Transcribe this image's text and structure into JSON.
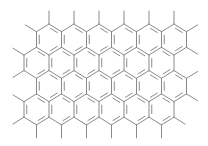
{
  "diagram": {
    "type": "chemical-structure",
    "line_color": "#8a8a8a",
    "background": "#ffffff",
    "hex": {
      "width": 25,
      "height": 31,
      "row_spacing": 23.3,
      "top_vertex_y": 24
    },
    "rows": [
      {
        "centers_x": [
          49,
          74,
          99,
          124,
          149,
          174
        ]
      },
      {
        "centers_x": [
          36.5,
          61.5,
          86.5,
          111.5,
          136.5,
          161.5
        ]
      },
      {
        "centers_x": [
          49,
          74,
          99,
          124,
          149,
          174
        ]
      },
      {
        "centers_x": [
          36.5,
          61.5,
          86.5,
          111.5,
          136.5,
          161.5
        ]
      }
    ],
    "substituent_length": 13
  }
}
